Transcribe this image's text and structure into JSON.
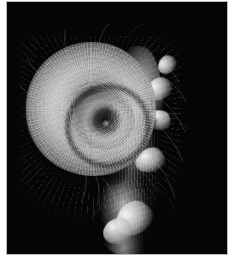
{
  "image": {
    "kind": "photograph",
    "subject": "fern fiddlehead",
    "subject_detail": "tightly coiled young fern frond (crozier / koru) densely covered in pale fuzzy hairs",
    "caption": "",
    "alt_text": "Macro photograph of a spiral fern fiddlehead covered in silvery hairs against a black background",
    "orientation": "portrait",
    "width_px": 234,
    "height_px": 256
  },
  "frame": {
    "matte_color": "#ffffff",
    "border_line_color": "#b9b9b9",
    "plate_left_px": 7,
    "plate_top_px": 2,
    "plate_width_px": 220,
    "plate_height_px": 252
  },
  "scene": {
    "background_color": "#050505",
    "background_label": "black studio backdrop",
    "lighting": "hard directional light from upper left",
    "palette": {
      "shadow": "#050505",
      "midtone": "#6e6e6d",
      "highlight": "#c8c8c6",
      "specular": "#f8f8f6"
    }
  },
  "subject_parts": [
    {
      "name": "coil",
      "label": "spiral crozier head",
      "center_x_px": 84,
      "center_y_px": 107,
      "diameter_px": 130,
      "turns": 2
    },
    {
      "name": "coil-core",
      "label": "dark spiral centre",
      "center_x_px": 99,
      "center_y_px": 119,
      "diameter_px": 26
    },
    {
      "name": "stem",
      "label": "hairy stipe descending to lower edge",
      "top_x_px": 125,
      "top_y_px": 44,
      "bottom_x_px": 120,
      "bottom_y_px": 254,
      "width_px": 58
    },
    {
      "name": "bracts",
      "label": "pale curled pinna lobes along the stipe",
      "count": 6
    }
  ]
}
